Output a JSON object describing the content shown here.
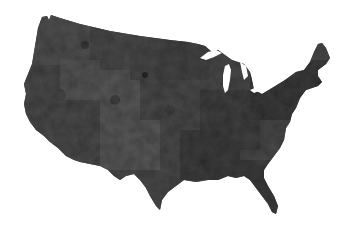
{
  "map": {
    "title": "",
    "region": "Contiguous United States",
    "style": "grayscale county-level choropleth",
    "colors": {
      "background": "#ffffff",
      "land_base": "#4a4a4a",
      "land_dark": "#333333",
      "land_light": "#5c5c5c",
      "water": "#ffffff"
    },
    "legend": null,
    "labels": []
  }
}
